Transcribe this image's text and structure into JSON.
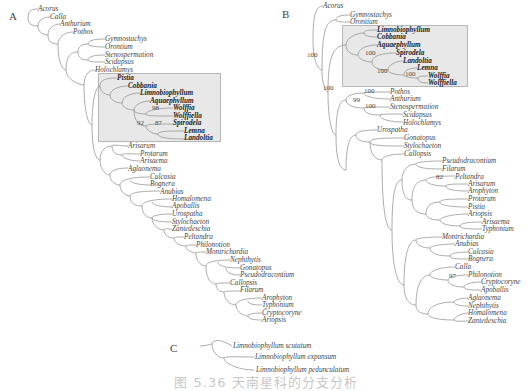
{
  "figure": {
    "caption": "图 5.36  天南星科的分支分析",
    "line_color": "#8a8a8a",
    "highlight_fill": "#e8e8e8",
    "highlight_border": "#b5b5b5"
  },
  "panelA": {
    "label": "A",
    "highlight": {
      "x": 98,
      "y": 73,
      "w": 123,
      "h": 69
    },
    "taxa": [
      {
        "name": "Acorus",
        "x": 38,
        "y": 5
      },
      {
        "name": "Calla",
        "x": 50,
        "y": 13
      },
      {
        "name": "Anthurium",
        "x": 60,
        "y": 20
      },
      {
        "name": "Pothos",
        "x": 73,
        "y": 28
      },
      {
        "name": "Gymnostachys",
        "x": 105,
        "y": 35
      },
      {
        "name": "Orontium",
        "x": 105,
        "y": 43
      },
      {
        "name": "Stenospermation",
        "x": 105,
        "y": 51
      },
      {
        "name": "Scidapsus",
        "x": 105,
        "y": 58
      },
      {
        "name": "Holochlamys",
        "x": 95,
        "y": 66
      },
      {
        "name": "Pistia",
        "x": 117,
        "y": 74,
        "bold": true
      },
      {
        "name": "Cobbania",
        "x": 128,
        "y": 82,
        "bold": true
      },
      {
        "name": "Limnobiophyllum",
        "x": 140,
        "y": 89,
        "bold": true
      },
      {
        "name": "Aquaephyllum",
        "x": 150,
        "y": 97,
        "bold": true
      },
      {
        "name": "Wolffia",
        "x": 173,
        "y": 104,
        "bold": true
      },
      {
        "name": "Wolffiella",
        "x": 173,
        "y": 112,
        "bold": true
      },
      {
        "name": "Spirodela",
        "x": 173,
        "y": 119,
        "bold": true
      },
      {
        "name": "Lemna",
        "x": 184,
        "y": 127,
        "bold": true
      },
      {
        "name": "Landoltia",
        "x": 184,
        "y": 134,
        "bold": true
      },
      {
        "name": "Arisarum",
        "x": 128,
        "y": 142
      },
      {
        "name": "Protarum",
        "x": 140,
        "y": 150
      },
      {
        "name": "Arisaema",
        "x": 140,
        "y": 157
      },
      {
        "name": "Aglaonema",
        "x": 128,
        "y": 165
      },
      {
        "name": "Culcasia",
        "x": 150,
        "y": 173
      },
      {
        "name": "Bognera",
        "x": 150,
        "y": 180
      },
      {
        "name": "Anubias",
        "x": 160,
        "y": 188
      },
      {
        "name": "Homalomena",
        "x": 172,
        "y": 195
      },
      {
        "name": "Apoballis",
        "x": 172,
        "y": 202
      },
      {
        "name": "Urospatha",
        "x": 172,
        "y": 210
      },
      {
        "name": "Stylochaeton",
        "x": 172,
        "y": 218
      },
      {
        "name": "Zantedeschia",
        "x": 172,
        "y": 225
      },
      {
        "name": "Peltandra",
        "x": 184,
        "y": 233
      },
      {
        "name": "Philonotion",
        "x": 196,
        "y": 241
      },
      {
        "name": "Montrichardia",
        "x": 206,
        "y": 248
      },
      {
        "name": "Nephthytis",
        "x": 230,
        "y": 256
      },
      {
        "name": "Gonatopus",
        "x": 240,
        "y": 264
      },
      {
        "name": "Pseudodracontium",
        "x": 240,
        "y": 271
      },
      {
        "name": "Callopsis",
        "x": 230,
        "y": 279
      },
      {
        "name": "Filarum",
        "x": 240,
        "y": 286
      },
      {
        "name": "Arophyton",
        "x": 262,
        "y": 294
      },
      {
        "name": "Typhonium",
        "x": 262,
        "y": 301
      },
      {
        "name": "Cryptocoryne",
        "x": 262,
        "y": 309
      },
      {
        "name": "Ariopsis",
        "x": 262,
        "y": 316
      }
    ],
    "supports": [
      {
        "value": "98",
        "x": 152,
        "y": 104
      },
      {
        "value": "92",
        "x": 137,
        "y": 119
      },
      {
        "value": "87",
        "x": 155,
        "y": 119
      }
    ]
  },
  "panelB": {
    "label": "B",
    "highlight": {
      "x": 342,
      "y": 25,
      "w": 126,
      "h": 62
    },
    "taxa": [
      {
        "name": "Acorus",
        "x": 323,
        "y": 2
      },
      {
        "name": "Gymnostachys",
        "x": 350,
        "y": 11
      },
      {
        "name": "Orontium",
        "x": 350,
        "y": 18
      },
      {
        "name": "Limnobiophyllum",
        "x": 377,
        "y": 26,
        "bold": true
      },
      {
        "name": "Cobbania",
        "x": 377,
        "y": 33,
        "bold": true
      },
      {
        "name": "Aquaephyllum",
        "x": 377,
        "y": 41,
        "bold": true
      },
      {
        "name": "Spirodela",
        "x": 396,
        "y": 49,
        "bold": true
      },
      {
        "name": "Landoltia",
        "x": 403,
        "y": 57,
        "bold": true
      },
      {
        "name": "Lemna",
        "x": 417,
        "y": 64,
        "bold": true
      },
      {
        "name": "Wolffia",
        "x": 428,
        "y": 72,
        "bold": true
      },
      {
        "name": "Wolffiella",
        "x": 428,
        "y": 79,
        "bold": true
      },
      {
        "name": "Pothos",
        "x": 390,
        "y": 88
      },
      {
        "name": "Anthurium",
        "x": 390,
        "y": 95
      },
      {
        "name": "Stenospermation",
        "x": 390,
        "y": 103
      },
      {
        "name": "Scidapsus",
        "x": 403,
        "y": 111
      },
      {
        "name": "Holochlamys",
        "x": 403,
        "y": 119
      },
      {
        "name": "Urospatha",
        "x": 377,
        "y": 126
      },
      {
        "name": "Gonatopus",
        "x": 404,
        "y": 134
      },
      {
        "name": "Stylochaeton",
        "x": 404,
        "y": 142
      },
      {
        "name": "Callopsis",
        "x": 404,
        "y": 150
      },
      {
        "name": "Pseudodracontium",
        "x": 442,
        "y": 157
      },
      {
        "name": "Filarum",
        "x": 442,
        "y": 165
      },
      {
        "name": "Peltandra",
        "x": 455,
        "y": 173
      },
      {
        "name": "Arisarum",
        "x": 468,
        "y": 180
      },
      {
        "name": "Arophyton",
        "x": 468,
        "y": 187
      },
      {
        "name": "Protarum",
        "x": 468,
        "y": 195
      },
      {
        "name": "Pistia",
        "x": 468,
        "y": 203
      },
      {
        "name": "Ariopsis",
        "x": 468,
        "y": 210
      },
      {
        "name": "Arisaema",
        "x": 482,
        "y": 218
      },
      {
        "name": "Typhonium",
        "x": 482,
        "y": 225
      },
      {
        "name": "Montrichardia",
        "x": 442,
        "y": 233
      },
      {
        "name": "Anubias",
        "x": 455,
        "y": 240
      },
      {
        "name": "Culcasia",
        "x": 468,
        "y": 248
      },
      {
        "name": "Bognera",
        "x": 468,
        "y": 255
      },
      {
        "name": "Calla",
        "x": 455,
        "y": 263
      },
      {
        "name": "Philonotion",
        "x": 468,
        "y": 271
      },
      {
        "name": "Cryptocoryne",
        "x": 481,
        "y": 278
      },
      {
        "name": "Apoballis",
        "x": 481,
        "y": 286
      },
      {
        "name": "Aglaonema",
        "x": 468,
        "y": 294
      },
      {
        "name": "Nephthytis",
        "x": 468,
        "y": 302
      },
      {
        "name": "Homalomena",
        "x": 468,
        "y": 309
      },
      {
        "name": "Zantedeschia",
        "x": 468,
        "y": 317
      }
    ],
    "supports": [
      {
        "value": "100",
        "x": 307,
        "y": 51
      },
      {
        "value": "100",
        "x": 365,
        "y": 49
      },
      {
        "value": "100",
        "x": 377,
        "y": 67
      },
      {
        "value": "100",
        "x": 405,
        "y": 70
      },
      {
        "value": "100",
        "x": 323,
        "y": 84
      },
      {
        "value": "100",
        "x": 364,
        "y": 87
      },
      {
        "value": "99",
        "x": 353,
        "y": 96
      },
      {
        "value": "100",
        "x": 365,
        "y": 102
      },
      {
        "value": "82",
        "x": 436,
        "y": 173
      },
      {
        "value": "97",
        "x": 449,
        "y": 272
      }
    ]
  },
  "panelC": {
    "label": "C",
    "taxa": [
      {
        "name": "Limnobiophyllum scutatum",
        "x": 233,
        "y": 342
      },
      {
        "name": "Limnobiophyllum expansum",
        "x": 255,
        "y": 353
      },
      {
        "name": "Limnobiophyllum pedunculatum",
        "x": 256,
        "y": 366
      }
    ]
  }
}
